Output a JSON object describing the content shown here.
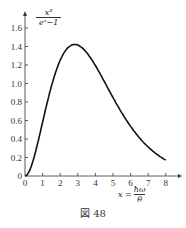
{
  "chart_data": {
    "type": "line",
    "title": "",
    "ylabel": {
      "numerator": "x³",
      "denominator": "eˣ−1"
    },
    "xlabel": {
      "lhs": "x =",
      "numerator": "ħω",
      "denominator": "θ"
    },
    "x_ticks": [
      "0",
      "1",
      "2",
      "3",
      "4",
      "5",
      "6",
      "7",
      "8"
    ],
    "y_ticks": [
      "0",
      "0.2",
      "0.4",
      "0.6",
      "0.8",
      "1.0",
      "1.2",
      "1.4",
      "1.6"
    ],
    "xlim": [
      0,
      8.5
    ],
    "ylim": [
      0,
      1.7
    ],
    "grid": false,
    "series": [
      {
        "name": "x^3/(e^x-1)",
        "x": [
          0,
          0.5,
          1,
          1.5,
          2,
          2.5,
          2.82,
          3,
          3.5,
          4,
          4.5,
          5,
          5.5,
          6,
          6.5,
          7,
          7.5,
          8
        ],
        "values": [
          0,
          0.193,
          0.582,
          0.972,
          1.252,
          1.4,
          1.421,
          1.419,
          1.335,
          1.199,
          1.03,
          0.851,
          0.679,
          0.537,
          0.413,
          0.313,
          0.235,
          0.172
        ]
      }
    ]
  },
  "caption": "図 48"
}
